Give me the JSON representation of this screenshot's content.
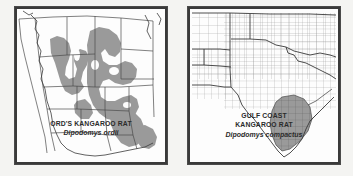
{
  "figure": {
    "type": "species-range-map-pair",
    "background_color": "#f4f4f2",
    "panel_background": "#fdfdfd",
    "frame_color": "#3a3a3a",
    "range_shading_color": "#9a9a9a",
    "boundary_line_color": "#4a4a4a",
    "caption_text_color": "#2b2b2b"
  },
  "panels": [
    {
      "id": "ords-kangaroo-rat",
      "position": "left",
      "common_name": "ORD'S KANGAROO RAT",
      "scientific_name": "Dipodomys ordii",
      "region_depicted": "western United States and northern Mexico",
      "boundary_type": "state",
      "range_description": "shaded distribution across the Great Plains, Great Basin and Southwest, extending into northern Mexico"
    },
    {
      "id": "gulf-coast-kangaroo-rat",
      "position": "right",
      "common_name_line1": "GULF COAST",
      "common_name_line2": "KANGAROO RAT",
      "scientific_name": "Dipodomys compactus",
      "region_depicted": "Texas and surrounding states",
      "boundary_type": "county",
      "range_description": "shaded distribution restricted to south Texas along the Gulf Coast"
    }
  ]
}
